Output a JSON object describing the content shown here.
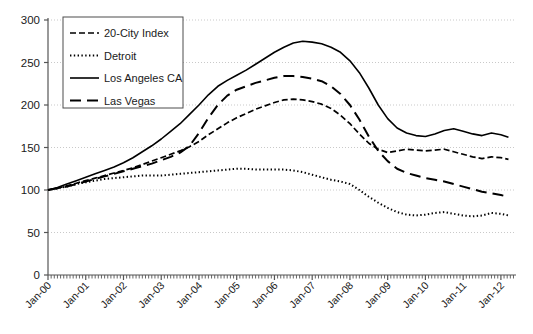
{
  "chart_data": {
    "type": "line",
    "title": "",
    "subtitle": "",
    "xlabel": "",
    "ylabel": "",
    "xlim": [
      0,
      12.4
    ],
    "ylim": [
      0,
      300
    ],
    "ytick_values": [
      0,
      50,
      100,
      150,
      200,
      250,
      300
    ],
    "ytick_labels": [
      "0",
      "50",
      "100",
      "150",
      "200",
      "250",
      "300"
    ],
    "xtick_labels": [
      "Jan-00",
      "Jan-01",
      "Jan-02",
      "Jan-03",
      "Jan-04",
      "Jan-05",
      "Jan-06",
      "Jan-07",
      "Jan-08",
      "Jan-09",
      "Jan-10",
      "Jan-11",
      "Jan-12"
    ],
    "xtick_values": [
      0,
      1,
      2,
      3,
      4,
      5,
      6,
      7,
      8,
      9,
      10,
      11,
      12
    ],
    "grid": "horizontal-dotted",
    "legend_position": "upper-left-inside",
    "minor_ticks": "monthly",
    "x_unit": "years from Jan-00",
    "series": [
      {
        "name": "20-City Index",
        "dash": "dashed",
        "color": "#000000",
        "x": [
          0,
          0.25,
          0.5,
          0.75,
          1,
          1.25,
          1.5,
          1.75,
          2,
          2.25,
          2.5,
          2.75,
          3,
          3.25,
          3.5,
          3.75,
          4,
          4.25,
          4.5,
          4.75,
          5,
          5.25,
          5.5,
          5.75,
          6,
          6.25,
          6.5,
          6.75,
          7,
          7.25,
          7.5,
          7.75,
          8,
          8.25,
          8.5,
          8.75,
          9,
          9.25,
          9.5,
          9.75,
          10,
          10.25,
          10.5,
          10.75,
          11,
          11.25,
          11.5,
          11.75,
          12,
          12.2
        ],
        "values": [
          100,
          102,
          105,
          108,
          111,
          114,
          117,
          120,
          123,
          126,
          130,
          134,
          138,
          142,
          146,
          151,
          157,
          165,
          172,
          179,
          185,
          190,
          195,
          199,
          203,
          206,
          207,
          206,
          204,
          201,
          196,
          188,
          178,
          166,
          155,
          148,
          144,
          146,
          148,
          147,
          146,
          147,
          148,
          145,
          142,
          139,
          137,
          139,
          138,
          136
        ]
      },
      {
        "name": "Detroit",
        "dash": "dotted",
        "color": "#000000",
        "x": [
          0,
          0.25,
          0.5,
          0.75,
          1,
          1.25,
          1.5,
          1.75,
          2,
          2.25,
          2.5,
          2.75,
          3,
          3.25,
          3.5,
          3.75,
          4,
          4.25,
          4.5,
          4.75,
          5,
          5.25,
          5.5,
          5.75,
          6,
          6.25,
          6.5,
          6.75,
          7,
          7.25,
          7.5,
          7.75,
          8,
          8.25,
          8.5,
          8.75,
          9,
          9.25,
          9.5,
          9.75,
          10,
          10.25,
          10.5,
          10.75,
          11,
          11.25,
          11.5,
          11.75,
          12,
          12.2
        ],
        "values": [
          100,
          102,
          104,
          107,
          109,
          111,
          113,
          114,
          115,
          116,
          117,
          117,
          117,
          118,
          119,
          120,
          121,
          122,
          123,
          124,
          125,
          125,
          124,
          124,
          124,
          124,
          123,
          121,
          118,
          115,
          112,
          110,
          107,
          100,
          92,
          85,
          79,
          74,
          71,
          70,
          71,
          73,
          74,
          72,
          70,
          69,
          70,
          73,
          72,
          70
        ]
      },
      {
        "name": "Los Angeles CA",
        "dash": "solid",
        "color": "#000000",
        "x": [
          0,
          0.25,
          0.5,
          0.75,
          1,
          1.25,
          1.5,
          1.75,
          2,
          2.25,
          2.5,
          2.75,
          3,
          3.25,
          3.5,
          3.75,
          4,
          4.25,
          4.5,
          4.75,
          5,
          5.25,
          5.5,
          5.75,
          6,
          6.25,
          6.5,
          6.75,
          7,
          7.25,
          7.5,
          7.75,
          8,
          8.25,
          8.5,
          8.75,
          9,
          9.25,
          9.5,
          9.75,
          10,
          10.25,
          10.5,
          10.75,
          11,
          11.25,
          11.5,
          11.75,
          12,
          12.2
        ],
        "values": [
          100,
          103,
          107,
          111,
          115,
          119,
          123,
          127,
          132,
          138,
          145,
          152,
          160,
          169,
          178,
          189,
          200,
          212,
          222,
          229,
          235,
          241,
          248,
          255,
          262,
          268,
          273,
          275,
          274,
          272,
          268,
          262,
          252,
          238,
          220,
          200,
          184,
          173,
          167,
          164,
          163,
          166,
          170,
          172,
          169,
          166,
          164,
          167,
          165,
          162
        ]
      },
      {
        "name": "Las Vegas",
        "dash": "long-dash",
        "color": "#000000",
        "x": [
          0,
          0.25,
          0.5,
          0.75,
          1,
          1.25,
          1.5,
          1.75,
          2,
          2.25,
          2.5,
          2.75,
          3,
          3.25,
          3.5,
          3.75,
          4,
          4.25,
          4.5,
          4.75,
          5,
          5.25,
          5.5,
          5.75,
          6,
          6.25,
          6.5,
          6.75,
          7,
          7.25,
          7.5,
          7.75,
          8,
          8.25,
          8.5,
          8.75,
          9,
          9.25,
          9.5,
          9.75,
          10,
          10.25,
          10.5,
          10.75,
          11,
          11.25,
          11.5,
          11.75,
          12,
          12.2
        ],
        "values": [
          100,
          102,
          104,
          107,
          110,
          113,
          116,
          119,
          122,
          125,
          128,
          131,
          135,
          139,
          144,
          152,
          167,
          185,
          200,
          211,
          218,
          222,
          226,
          229,
          232,
          234,
          234,
          233,
          231,
          228,
          222,
          213,
          200,
          183,
          163,
          146,
          134,
          125,
          120,
          117,
          114,
          112,
          110,
          107,
          104,
          101,
          98,
          96,
          94,
          92
        ]
      }
    ]
  },
  "legend": {
    "entries": [
      {
        "label": "20-City Index",
        "dash": "dashed"
      },
      {
        "label": "Detroit",
        "dash": "dotted"
      },
      {
        "label": "Los Angeles CA",
        "dash": "solid"
      },
      {
        "label": "Las Vegas",
        "dash": "long-dash"
      }
    ]
  }
}
